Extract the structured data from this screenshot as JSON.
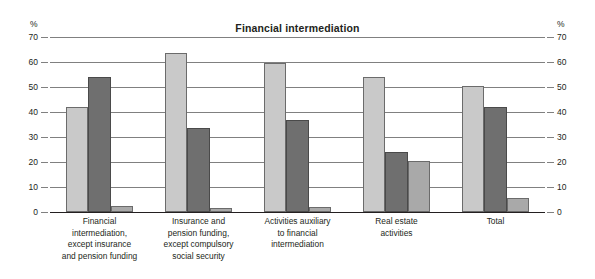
{
  "chart_data": {
    "type": "bar",
    "title": "Financial intermediation",
    "xlabel": "",
    "ylabel": "%",
    "unit_label_left": "%",
    "unit_label_right": "%",
    "ylim": [
      0,
      70
    ],
    "yticks": [
      0,
      10,
      20,
      30,
      40,
      50,
      60,
      70
    ],
    "ytick_labels": [
      "0",
      "10",
      "20",
      "30",
      "40",
      "50",
      "60",
      "70"
    ],
    "grid": true,
    "grid_axis": "y",
    "legend": "none",
    "dual_axis": true,
    "categories": [
      "Financial intermediation, except insurance and pension funding",
      "Insurance and pension funding, except compulsory social security",
      "Activities auxiliary to financial intermediation",
      "Real estate activities",
      "Total"
    ],
    "category_lines": [
      [
        "Financial",
        "intermediation,",
        "except insurance",
        "and pension funding"
      ],
      [
        "Insurance and",
        "pension funding,",
        "except compulsory",
        "social security"
      ],
      [
        "Activities auxiliary",
        "to financial",
        "intermediation"
      ],
      [
        "Real estate",
        "activities"
      ],
      [
        "Total"
      ]
    ],
    "series": [
      {
        "name": "series-1",
        "color": "#c9c9c9",
        "values": [
          42.0,
          63.5,
          59.5,
          54.0,
          50.5
        ]
      },
      {
        "name": "series-2",
        "color": "#6f6f6f",
        "values": [
          54.0,
          33.5,
          37.0,
          24.0,
          42.0
        ]
      },
      {
        "name": "series-3",
        "color": "#a9a9a9",
        "values": [
          2.5,
          1.5,
          2.0,
          20.5,
          5.5
        ]
      }
    ]
  }
}
